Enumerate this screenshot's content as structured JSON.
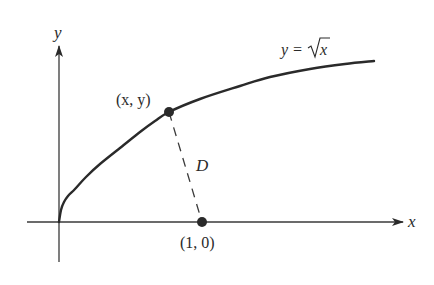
{
  "figure": {
    "colors": {
      "ink": "#2a2a2a",
      "axis": "#3a3a3a",
      "background": "#ffffff"
    },
    "axes": {
      "x_label": "x",
      "y_label": "y",
      "origin_px": [
        59,
        222
      ],
      "x_axis_px": {
        "start": 27,
        "end": 403
      },
      "y_axis_px": {
        "top": 46,
        "bottom": 262
      }
    },
    "curve": {
      "equation_label_lhs": "y =",
      "equation_label_radicand": "x",
      "points_px": [
        [
          59,
          222
        ],
        [
          61,
          210
        ],
        [
          64,
          202
        ],
        [
          68,
          196
        ],
        [
          75,
          189
        ],
        [
          86,
          177
        ],
        [
          100,
          164
        ],
        [
          120,
          148
        ],
        [
          140,
          132
        ],
        [
          155,
          121
        ],
        [
          169,
          112
        ],
        [
          200,
          99
        ],
        [
          240,
          86
        ],
        [
          270,
          77
        ],
        [
          310,
          69
        ],
        [
          345,
          64
        ],
        [
          374,
          61
        ]
      ]
    },
    "points": {
      "curve_point": {
        "label": "(x, y)",
        "px": [
          169,
          112
        ]
      },
      "fixed_point": {
        "label": "(1, 0)",
        "px": [
          202,
          222
        ]
      }
    },
    "segment": {
      "label": "D",
      "style": "dashed"
    }
  }
}
